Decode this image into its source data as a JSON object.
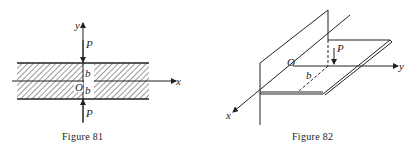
{
  "figures": [
    {
      "id": "fig81",
      "caption": "Figure 81",
      "labels": {
        "y_axis": "y",
        "x_axis": "x",
        "load_top": "P",
        "load_bottom": "P",
        "half_width_top": "b",
        "half_width_bottom": "b",
        "origin": "O"
      }
    },
    {
      "id": "fig82",
      "caption": "Figure 82",
      "labels": {
        "x_axis": "x",
        "y_axis": "y",
        "load": "P",
        "distance": "b",
        "origin": "O"
      }
    }
  ],
  "colors": {
    "ink": "#222222",
    "background": "#ffffff"
  }
}
